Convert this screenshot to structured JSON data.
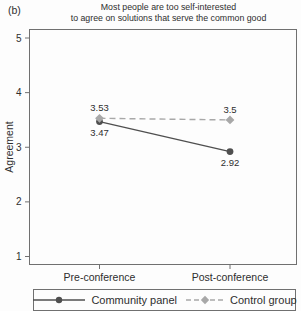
{
  "panel_label": "(b)",
  "title": {
    "line1": "Most people are too self-interested",
    "line2": "to agree on solutions that serve the common good"
  },
  "chart_data": {
    "type": "line",
    "title": "Most people are too self-interested to agree on solutions that serve the common good",
    "categories": [
      "Pre-conference",
      "Post-conference"
    ],
    "series": [
      {
        "name": "Community panel",
        "values": [
          3.47,
          2.92
        ],
        "point_labels": [
          "3.47",
          "2.92"
        ],
        "label_position": "below",
        "line_style": "solid",
        "marker": "circle",
        "color": "#4f4f4f"
      },
      {
        "name": "Control group",
        "values": [
          3.53,
          3.5
        ],
        "point_labels": [
          "3.53",
          "3.5"
        ],
        "label_position": "above",
        "line_style": "dashed",
        "marker": "diamond",
        "color": "#a8a8a8"
      }
    ],
    "xlabel": "",
    "ylabel": "Agreement",
    "ylim": [
      1,
      5
    ],
    "yticks": [
      1,
      2,
      3,
      4,
      5
    ],
    "grid": false,
    "legend_position": "bottom"
  },
  "legend": {
    "items": [
      {
        "label": "Community panel"
      },
      {
        "label": "Control group"
      }
    ]
  },
  "colors": {
    "axis": "#707070",
    "text": "#2e2e2e",
    "community": "#4f4f4f",
    "control": "#a8a8a8",
    "background": "#fdfdfd"
  }
}
